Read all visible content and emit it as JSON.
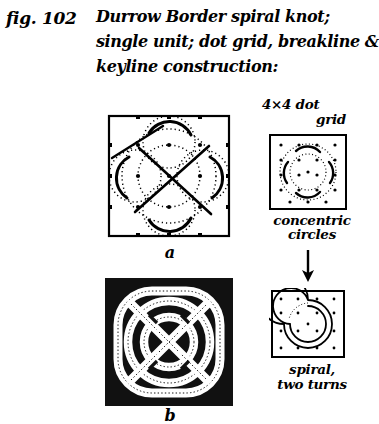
{
  "figure": {
    "number_label": "fig. 102",
    "caption_lines": [
      "Durrow Border spiral knot;",
      "single unit; dot grid, breakline &",
      "keyline construction:"
    ]
  },
  "panels": {
    "construction": {
      "name": "keyline-construction-diagram",
      "caption": "a",
      "description": "square dot-grid panel with dotted keylines, dotted circles, solid diagonal breaklines and dark arcs"
    },
    "knot": {
      "name": "finished-knot-diagram",
      "caption": "b",
      "description": "solid black square panel with white interlaced spiral knot bands outlined in dots"
    },
    "dot_grid": {
      "name": "dot-grid-diagram",
      "label_line1": "4×4 dot",
      "label_line2": "grid",
      "below_label_line1": "concentric",
      "below_label_line2": "circles",
      "grid_columns": 6,
      "grid_rows": 6
    },
    "spiral": {
      "name": "spiral-diagram",
      "label_line1": "spiral,",
      "label_line2": "two turns",
      "turns": 2
    }
  },
  "arrow": {
    "direction": "down",
    "name": "flow-arrow-down"
  },
  "colors": {
    "ink": "#000000",
    "page": "#ffffff",
    "knot_background": "#111111"
  }
}
